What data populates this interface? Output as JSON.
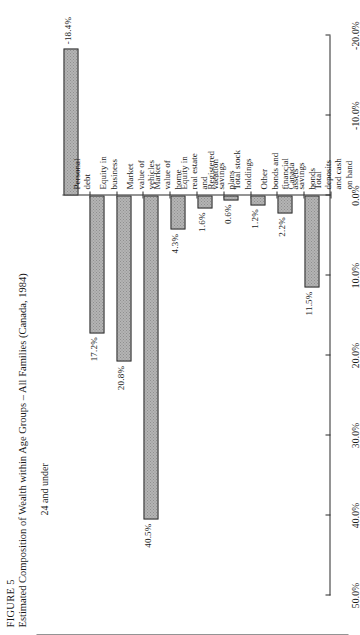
{
  "figure": {
    "number": "FIGURE 5",
    "title": "Estimated Composition of Wealth within Age Groups – All Families (Canada, 1984)",
    "subtitle": "24 and under"
  },
  "axis": {
    "tick_labels": [
      "50.0%",
      "40.0%",
      "30.0%",
      "20.0%",
      "10.0%",
      "0.0%",
      "-10.0%",
      "-20.0%"
    ],
    "tick_values": [
      50,
      40,
      30,
      20,
      10,
      0,
      -10,
      -20
    ],
    "min": -20,
    "max": 50
  },
  "chart_data": {
    "type": "bar",
    "title": "Estimated Composition of Wealth within Age Groups – All Families (Canada, 1984)",
    "subtitle": "24 and under",
    "orientation": "horizontal-rotated",
    "xlabel": "",
    "ylabel": "",
    "ylim": [
      -20,
      50
    ],
    "grid": false,
    "legend": "none",
    "categories": [
      "Total\ndeposits\nand cash\non hand",
      "Canada\nsavings\nbonds",
      "Other\nbonds and\nfinancial\nassets",
      "Total stock\nholdings",
      "Registered\nsavings\nplans",
      "Equity in\nreal estate\nand\nvacation",
      "Market\nvalue of\nhome",
      "Market\nvalue of\nvehicles",
      "Equity in\nbusiness",
      "Personal\ndebt"
    ],
    "values": [
      11.5,
      2.2,
      1.2,
      0.6,
      1.6,
      4.3,
      40.5,
      20.8,
      17.2,
      -18.4
    ],
    "value_labels": [
      "11.5%",
      "2.2%",
      "1.2%",
      "0.6%",
      "1.6%",
      "4.3%",
      "40.5%",
      "20.8%",
      "17.2%",
      "-18.4%"
    ]
  },
  "colors": {
    "bar_fill": "#b4b4b4",
    "bar_pattern": "#8f8f8f",
    "bar_stroke": "#2f2f2f",
    "axis": "#2b2b2b",
    "text": "#1a1a1a",
    "background": "#ffffff"
  }
}
